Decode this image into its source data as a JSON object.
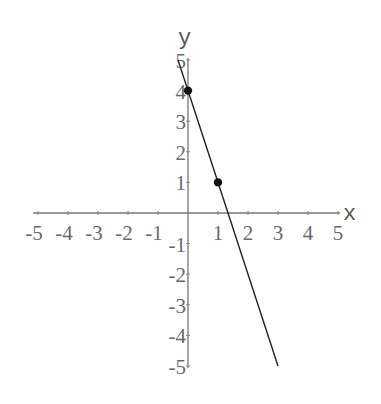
{
  "chart_data": {
    "type": "line",
    "title": "",
    "xlabel": "x",
    "ylabel": "y",
    "xlim": [
      -5,
      5
    ],
    "ylim": [
      -5,
      5
    ],
    "grid": false,
    "legend": null,
    "x_ticks": [
      -5,
      -4,
      -3,
      -2,
      -1,
      1,
      2,
      3,
      4,
      5
    ],
    "y_ticks": [
      -5,
      -4,
      -3,
      -2,
      -1,
      1,
      2,
      3,
      4,
      5
    ],
    "x_tick_labels": [
      "-5",
      "-4",
      "-3",
      "-2",
      "-1",
      "1",
      "2",
      "3",
      "4",
      "5"
    ],
    "y_tick_labels": [
      "-5",
      "-4",
      "-3",
      "-2",
      "-1",
      "1",
      "2",
      "3",
      "4",
      "5"
    ],
    "series": [
      {
        "name": "y = -3x + 4",
        "kind": "line",
        "equation": "y = -3x + 4",
        "x": [
          -0.333,
          3
        ],
        "y": [
          5,
          -5
        ]
      },
      {
        "name": "points",
        "kind": "scatter",
        "x": [
          0,
          1
        ],
        "y": [
          4,
          1
        ]
      }
    ]
  },
  "layout": {
    "origin_px": [
      188,
      213
    ],
    "x_unit_px": 30,
    "y_unit_px": 30.6,
    "colors": {
      "axis": "#777777",
      "line": "#222222",
      "point": "#111111",
      "text": "#6a6a6a"
    }
  }
}
